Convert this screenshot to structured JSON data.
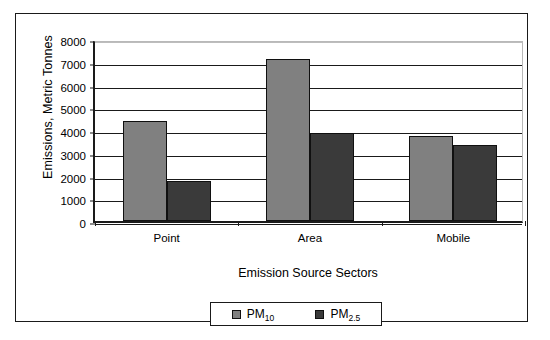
{
  "chart_data": {
    "type": "bar",
    "title": "",
    "xlabel": "Emission Source Sectors",
    "ylabel": "Emissions, Metric Tonnes",
    "categories": [
      "Point",
      "Area",
      "Mobile"
    ],
    "series": [
      {
        "name": "PM10",
        "label_main": "PM",
        "label_sub": "10",
        "color": "#808080",
        "values": [
          4400,
          7100,
          3750
        ]
      },
      {
        "name": "PM2.5",
        "label_main": "PM",
        "label_sub": "2.5",
        "color": "#3a3a3a",
        "values": [
          1750,
          3850,
          3350
        ]
      }
    ],
    "ylim": [
      0,
      8000
    ],
    "ytick_step": 1000,
    "yticks": [
      "8000",
      "7000",
      "6000",
      "5000",
      "4000",
      "3000",
      "2000",
      "1000",
      "0"
    ],
    "ytick_values": [
      8000,
      7000,
      6000,
      5000,
      4000,
      3000,
      2000,
      1000,
      0
    ],
    "grid": true,
    "legend_position": "bottom-center"
  },
  "axis": {
    "y_title": "Emissions, Metric Tonnes",
    "x_title": "Emission Source Sectors"
  }
}
